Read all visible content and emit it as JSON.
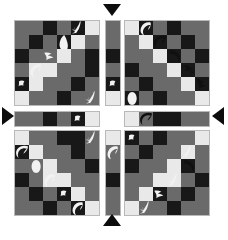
{
  "canvas": {
    "width": 228,
    "height": 231,
    "background": "#ffffff"
  },
  "palette": {
    "dark": "#181818",
    "mid": "#6a6a6a",
    "mid_alt": "#5e5e5e",
    "light": "#e9e9e9",
    "border": "#b9b9b9",
    "arrow": "#0c0c0c"
  },
  "legend": {
    "cell_codes": {
      "d": "dark",
      "m": "mid-gray",
      "m2": "mid-gray-alt",
      "l": "light"
    }
  },
  "panels": [
    {
      "id": "top-left",
      "name": "grid-top-left",
      "x": 14,
      "y": 20,
      "cell": 14,
      "cols": 6,
      "rows": 6,
      "cells": [
        [
          "m",
          "m",
          "d",
          "m",
          "d",
          "l"
        ],
        [
          "m",
          "d",
          "m",
          "d",
          "l",
          "m"
        ],
        [
          "d",
          "m",
          "m",
          "l",
          "m",
          "d"
        ],
        [
          "m",
          "l",
          "l",
          "m",
          "m",
          "d"
        ],
        [
          "d",
          "l",
          "m",
          "m",
          "d",
          "m"
        ],
        [
          "l",
          "m",
          "m",
          "d",
          "m",
          "m"
        ]
      ],
      "blobs": [
        {
          "cell": [
            0,
            4
          ],
          "shape": "sprig",
          "tone": "light",
          "name": "blob-sprig"
        },
        {
          "cell": [
            1,
            3
          ],
          "shape": "leaf",
          "tone": "light",
          "name": "blob-leaf"
        },
        {
          "cell": [
            2,
            2
          ],
          "shape": "arrowhead",
          "tone": "light",
          "name": "blob-arrowhead"
        },
        {
          "cell": [
            3,
            1
          ],
          "shape": "crescent",
          "tone": "light",
          "name": "blob-crescent"
        },
        {
          "cell": [
            4,
            0
          ],
          "shape": "speck",
          "tone": "light",
          "name": "blob-speck"
        },
        {
          "cell": [
            5,
            5
          ],
          "shape": "sprig",
          "tone": "light",
          "name": "blob-sprig"
        }
      ]
    },
    {
      "id": "top-right",
      "name": "grid-top-right",
      "x": 124,
      "y": 20,
      "cell": 14,
      "cols": 6,
      "rows": 6,
      "cells": [
        [
          "l",
          "d",
          "m",
          "d",
          "m",
          "m"
        ],
        [
          "m",
          "l",
          "d",
          "m",
          "d",
          "m"
        ],
        [
          "m",
          "m",
          "l",
          "d",
          "m",
          "d"
        ],
        [
          "d",
          "m",
          "m",
          "l",
          "d",
          "m"
        ],
        [
          "m",
          "d",
          "m",
          "m",
          "l",
          "d"
        ],
        [
          "d",
          "m",
          "d",
          "m",
          "m",
          "l"
        ]
      ],
      "blobs": [
        {
          "cell": [
            0,
            1
          ],
          "shape": "crescent",
          "tone": "light",
          "name": "blob-crescent"
        },
        {
          "cell": [
            1,
            2
          ],
          "shape": "swirl",
          "tone": "dark",
          "name": "blob-swirl"
        },
        {
          "cell": [
            2,
            3
          ],
          "shape": "hook",
          "tone": "dark",
          "name": "blob-hook"
        },
        {
          "cell": [
            3,
            4
          ],
          "shape": "hand",
          "tone": "dark",
          "name": "blob-hand"
        },
        {
          "cell": [
            4,
            5
          ],
          "shape": "claw",
          "tone": "dark",
          "name": "blob-claw"
        },
        {
          "cell": [
            5,
            0
          ],
          "shape": "oval",
          "tone": "light",
          "name": "blob-oval"
        }
      ]
    },
    {
      "id": "bottom-left",
      "name": "grid-bottom-left",
      "x": 14,
      "y": 130,
      "cell": 14,
      "cols": 6,
      "rows": 6,
      "cells": [
        [
          "l",
          "m",
          "m",
          "d",
          "d",
          "m"
        ],
        [
          "d",
          "l",
          "m",
          "m",
          "d",
          "m"
        ],
        [
          "m",
          "m",
          "l",
          "m",
          "m",
          "d"
        ],
        [
          "d",
          "m",
          "l",
          "l",
          "m",
          "m"
        ],
        [
          "m",
          "d",
          "m",
          "d",
          "l",
          "m"
        ],
        [
          "m",
          "m",
          "d",
          "m",
          "d",
          "l"
        ]
      ],
      "blobs": [
        {
          "cell": [
            0,
            5
          ],
          "shape": "sprig",
          "tone": "light",
          "name": "blob-sprig"
        },
        {
          "cell": [
            1,
            0
          ],
          "shape": "swirl",
          "tone": "light",
          "name": "blob-swirl"
        },
        {
          "cell": [
            2,
            1
          ],
          "shape": "oval",
          "tone": "light",
          "name": "blob-oval"
        },
        {
          "cell": [
            3,
            2
          ],
          "shape": "crescent",
          "tone": "light",
          "name": "blob-crescent"
        },
        {
          "cell": [
            4,
            3
          ],
          "shape": "speck",
          "tone": "light",
          "name": "blob-speck"
        },
        {
          "cell": [
            5,
            4
          ],
          "shape": "crescent",
          "tone": "light",
          "name": "blob-crescent"
        }
      ]
    },
    {
      "id": "bottom-right",
      "name": "grid-bottom-right",
      "x": 124,
      "y": 130,
      "cell": 14,
      "cols": 6,
      "rows": 6,
      "cells": [
        [
          "d",
          "m",
          "d",
          "m",
          "m",
          "l"
        ],
        [
          "m",
          "d",
          "m",
          "m",
          "l",
          "m"
        ],
        [
          "d",
          "m",
          "m",
          "l",
          "d",
          "m"
        ],
        [
          "m",
          "m",
          "l",
          "l",
          "m",
          "d"
        ],
        [
          "m",
          "l",
          "d",
          "m",
          "d",
          "m"
        ],
        [
          "l",
          "m",
          "m",
          "d",
          "m",
          "m"
        ]
      ],
      "blobs": [
        {
          "cell": [
            0,
            0
          ],
          "shape": "speck",
          "tone": "light",
          "name": "blob-speck"
        },
        {
          "cell": [
            1,
            4
          ],
          "shape": "sprig",
          "tone": "light",
          "name": "blob-sprig"
        },
        {
          "cell": [
            2,
            4
          ],
          "shape": "hook",
          "tone": "dark",
          "name": "blob-hook"
        },
        {
          "cell": [
            3,
            3
          ],
          "shape": "sprig",
          "tone": "light",
          "name": "blob-sprig"
        },
        {
          "cell": [
            4,
            2
          ],
          "shape": "arrowhead",
          "tone": "light",
          "name": "blob-arrowhead"
        },
        {
          "cell": [
            5,
            1
          ],
          "shape": "sprig",
          "tone": "light",
          "name": "blob-sprig"
        }
      ]
    }
  ],
  "strips": [
    {
      "id": "strip-top-center",
      "name": "strip-vertical-top",
      "orientation": "vertical",
      "x": 105,
      "y": 20,
      "cell": 14,
      "cols": 1,
      "rows": 6,
      "cells": [
        [
          "m"
        ],
        [
          "m"
        ],
        [
          "d"
        ],
        [
          "m"
        ],
        [
          "d"
        ],
        [
          "l"
        ]
      ],
      "blobs": [
        {
          "cell": [
            4,
            0
          ],
          "shape": "speck",
          "tone": "light",
          "name": "blob-speck"
        }
      ]
    },
    {
      "id": "strip-bottom-center",
      "name": "strip-vertical-bottom",
      "orientation": "vertical",
      "x": 105,
      "y": 130,
      "cell": 14,
      "cols": 1,
      "rows": 6,
      "cells": [
        [
          "l"
        ],
        [
          "m"
        ],
        [
          "m"
        ],
        [
          "d"
        ],
        [
          "m"
        ],
        [
          "m"
        ]
      ],
      "blobs": [
        {
          "cell": [
            1,
            0
          ],
          "shape": "crescent",
          "tone": "light",
          "name": "blob-crescent"
        }
      ]
    },
    {
      "id": "strip-left-middle",
      "name": "strip-horizontal-left",
      "orientation": "horizontal",
      "x": 14,
      "y": 111,
      "cell": 14,
      "cols": 6,
      "rows": 1,
      "cells": [
        [
          "m",
          "m",
          "d",
          "m",
          "d",
          "l"
        ]
      ],
      "blobs": [
        {
          "cell": [
            0,
            4
          ],
          "shape": "speck",
          "tone": "light",
          "name": "blob-speck"
        }
      ]
    },
    {
      "id": "strip-right-middle",
      "name": "strip-horizontal-right",
      "orientation": "horizontal",
      "x": 124,
      "y": 111,
      "cell": 14,
      "cols": 6,
      "rows": 1,
      "cells": [
        [
          "l",
          "m",
          "d",
          "d",
          "m",
          "m"
        ]
      ],
      "blobs": [
        {
          "cell": [
            0,
            1
          ],
          "shape": "swirl",
          "tone": "dark",
          "name": "blob-swirl"
        }
      ]
    }
  ],
  "arrows": [
    {
      "id": "arrow-top",
      "name": "arrow-down-marker",
      "direction": "down",
      "x": 103,
      "y": 4
    },
    {
      "id": "arrow-bottom",
      "name": "arrow-up-marker",
      "direction": "up",
      "x": 103,
      "y": 214
    },
    {
      "id": "arrow-left",
      "name": "arrow-right-marker",
      "direction": "right",
      "x": 2,
      "y": 107
    },
    {
      "id": "arrow-right",
      "name": "arrow-left-marker",
      "direction": "left",
      "x": 212,
      "y": 107
    }
  ]
}
